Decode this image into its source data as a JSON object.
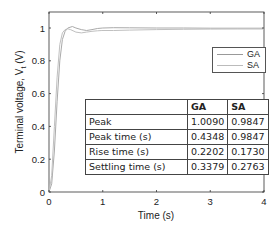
{
  "chart_data": {
    "type": "line",
    "title": "",
    "xlabel": "Time (s)",
    "ylabel": "Terminal voltage, V_t (V)",
    "xlim": [
      0,
      4
    ],
    "ylim": [
      0,
      1.1
    ],
    "x_ticks": [
      "0",
      "1",
      "2",
      "3",
      "4"
    ],
    "y_ticks": [
      "0",
      "0.2",
      "0.4",
      "0.6",
      "0.8",
      "1"
    ],
    "grid": false,
    "legend_position": "upper right",
    "series": [
      {
        "name": "GA",
        "color": "#aaaaaa",
        "x": [
          0,
          0.05,
          0.1,
          0.15,
          0.2,
          0.25,
          0.3,
          0.35,
          0.4348,
          0.5,
          0.6,
          0.7,
          0.8,
          0.9,
          1.0,
          1.2,
          1.5,
          2.0,
          2.5,
          3.0,
          3.5,
          4.0
        ],
        "values": [
          0,
          0.05,
          0.25,
          0.55,
          0.8,
          0.93,
          0.98,
          1.0,
          1.009,
          1.0,
          0.99,
          0.985,
          0.99,
          0.997,
          1.0,
          1.002,
          1.001,
          1.0,
          1.0,
          0.999,
          0.999,
          0.999
        ]
      },
      {
        "name": "SA",
        "color": "#c0c0c0",
        "x": [
          0,
          0.05,
          0.1,
          0.15,
          0.2,
          0.25,
          0.3,
          0.35,
          0.4,
          0.5,
          0.6,
          0.7,
          0.8,
          0.9,
          0.9847,
          1.2,
          1.5,
          2.0,
          2.5,
          3.0,
          3.5,
          4.0
        ],
        "values": [
          0,
          0.1,
          0.4,
          0.7,
          0.9,
          0.97,
          0.99,
          0.995,
          0.99,
          0.975,
          0.97,
          0.975,
          0.98,
          0.983,
          0.9847,
          0.985,
          0.987,
          0.99,
          0.992,
          0.993,
          0.994,
          0.994
        ]
      }
    ],
    "table": {
      "columns": [
        "",
        "GA",
        "SA"
      ],
      "rows": [
        [
          "Peak",
          "1.0090",
          "0.9847"
        ],
        [
          "Peak time (s)",
          "0.4348",
          "0.9847"
        ],
        [
          "Rise time (s)",
          "0.2202",
          "0.1730"
        ],
        [
          "Settling time (s)",
          "0.3379",
          "0.2763"
        ]
      ]
    }
  },
  "labels": {
    "xlabel": "Time (s)",
    "ylabel_main": "Terminal voltage, V",
    "ylabel_sub": "t",
    "ylabel_unit": " (V)"
  },
  "legend": {
    "items": [
      {
        "label": "GA"
      },
      {
        "label": "SA"
      }
    ]
  },
  "table": {
    "header": [
      "",
      "GA",
      "SA"
    ],
    "rows": [
      {
        "metric": "Peak",
        "ga": "1.0090",
        "sa": "0.9847"
      },
      {
        "metric": "Peak time (s)",
        "ga": "0.4348",
        "sa": "0.9847"
      },
      {
        "metric": "Rise time (s)",
        "ga": "0.2202",
        "sa": "0.1730"
      },
      {
        "metric": "Settling time (s)",
        "ga": "0.3379",
        "sa": "0.2763"
      }
    ]
  },
  "axes": {
    "x_ticks": [
      "0",
      "1",
      "2",
      "3",
      "4"
    ],
    "y_ticks": [
      "0",
      "0.2",
      "0.4",
      "0.6",
      "0.8",
      "1"
    ]
  }
}
